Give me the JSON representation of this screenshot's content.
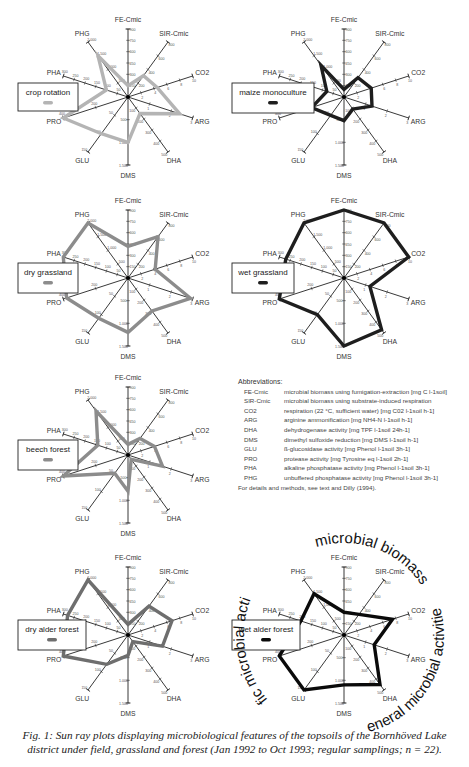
{
  "figure": {
    "caption_line1": "Fig. 1: Sun ray plots displaying microbiological features of the topsoils of the Bornhöved Lake",
    "caption_line2": "district under field, grassland and forest (Jan 1992 to Oct  1993; regular samplings; n = 22)."
  },
  "abbreviations": {
    "title": "Abbreviations:",
    "items": [
      {
        "key": "FE-Cmic",
        "text": "microbial biomass using fumigation-extraction [mg C l-1soil]"
      },
      {
        "key": "SIR-Cmic",
        "text": "microbial biomass using substrate-induced respiration"
      },
      {
        "key": "CO2",
        "text": "respiration (22 °C, sufficient water)  [mg C02 l-1soil h-1]"
      },
      {
        "key": "ARG",
        "text": "arginine ammonification  [mg NH4-N  l-1soil h-1]"
      },
      {
        "key": "DHA",
        "text": "dehydrogenase activity  [mg TPF  l-1soil 24h-1]"
      },
      {
        "key": "DMS",
        "text": "dimethyl sulfoxide reduction  [mg DMS  l-1soil h-1]"
      },
      {
        "key": "GLU",
        "text": "ß-glucosidase activity  [mg Phenol  l-1soil 3h-1]"
      },
      {
        "key": "PRO",
        "text": "protease activity  [mg Tyrosine eq  l-1soil 2h-1]"
      },
      {
        "key": "PHA",
        "text": "alkaline phosphatase activity  [mg Phenol  l-1soil 3h-1]"
      },
      {
        "key": "PHG",
        "text": "unbuffered phosphatase activity  [mg Phenol  l-1soil 3h-1]"
      }
    ],
    "footer": "For details and methods, see text and Dilly (1994)."
  },
  "group_labels": {
    "microbial_biomass": "microbial biomass",
    "general_activities": "general microbial activities",
    "specific_activities": "specific microbial activities"
  },
  "chart_data": {
    "type": "radar",
    "axes": [
      {
        "name": "FE-Cmic",
        "max": 900,
        "ticks": [
          "150",
          "300",
          "450",
          "600",
          "750",
          "900"
        ]
      },
      {
        "name": "SIR-Cmic",
        "max": 800,
        "ticks": [
          "200",
          "400",
          "600",
          "800"
        ]
      },
      {
        "name": "CO2",
        "max": 10,
        "ticks": [
          "2",
          "4",
          "6",
          "8",
          "10"
        ]
      },
      {
        "name": "ARG",
        "max": 3,
        "ticks": [
          "1",
          "2",
          "3"
        ]
      },
      {
        "name": "DHA",
        "max": 500,
        "ticks": [
          "100",
          "200",
          "300",
          "400",
          "500"
        ]
      },
      {
        "name": "DMS",
        "max": 1500,
        "ticks": [
          "500",
          "1.000",
          "1.500"
        ]
      },
      {
        "name": "GLU",
        "max": 150,
        "ticks": [
          "50",
          "100",
          "150"
        ]
      },
      {
        "name": "PRO",
        "max": 400,
        "ticks": [
          "200",
          "400"
        ]
      },
      {
        "name": "PHA",
        "max": 300,
        "ticks": [
          "50",
          "100",
          "150",
          "200",
          "250",
          "300"
        ]
      },
      {
        "name": "PHG",
        "max": 2000,
        "ticks": [
          "500",
          "1.000",
          "1.500",
          "2.000"
        ]
      }
    ],
    "series": [
      {
        "name": "crop rotation",
        "color": "#b4b4b4",
        "values": [
          150,
          310,
          4.5,
          2.4,
          150,
          1000,
          100,
          420,
          100,
          1500
        ]
      },
      {
        "name": "maize monoculture",
        "color": "#1e1e1e",
        "values": [
          100,
          280,
          4.2,
          1.3,
          110,
          520,
          50,
          200,
          80,
          1150
        ]
      },
      {
        "name": "dry grassland",
        "color": "#8c8c8c",
        "values": [
          420,
          600,
          4.2,
          2.9,
          300,
          1200,
          110,
          380,
          300,
          2100
        ]
      },
      {
        "name": "wet grassland",
        "color": "#1e1e1e",
        "values": [
          900,
          800,
          10,
          1.2,
          470,
          1500,
          100,
          420,
          270,
          2000
        ]
      },
      {
        "name": "beech forest",
        "color": "#8c8c8c",
        "values": [
          140,
          240,
          4.1,
          1.6,
          40,
          800,
          50,
          500,
          140,
          1600
        ]
      },
      {
        "name": "dry alder forest",
        "color": "#6e6e6e",
        "values": [
          140,
          420,
          6.8,
          1.6,
          60,
          450,
          80,
          420,
          280,
          2000
        ]
      },
      {
        "name": "wet alder forest",
        "color": "#0a0a0a",
        "values": [
          300,
          300,
          7.5,
          1.4,
          450,
          1100,
          150,
          460,
          200,
          1500
        ]
      }
    ],
    "legend_position": "left of each plot"
  }
}
